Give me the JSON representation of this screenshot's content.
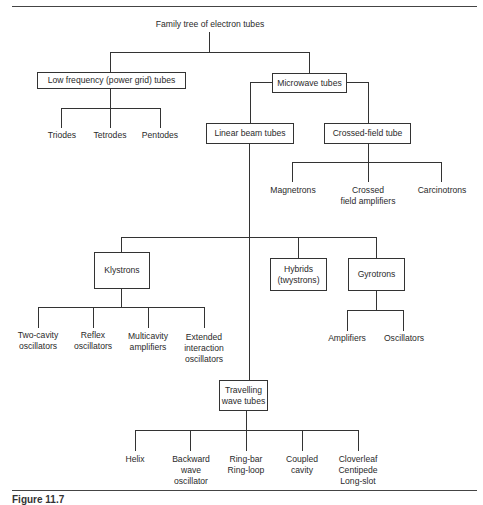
{
  "diagram": {
    "title": "Family tree of electron tubes",
    "caption": "Figure 11.7",
    "nodes": {
      "low_frequency": "Low frequency (power grid) tubes",
      "microwave": "Microwave tubes",
      "linear_beam": "Linear beam tubes",
      "crossed_field": "Crossed-field tube",
      "klystrons": "Klystrons",
      "hybrids": "Hybrids\n(twystrons)",
      "gyrotrons": "Gyrotrons",
      "twt": "Travelling\nwave tubes"
    },
    "low_frequency_children": [
      "Triodes",
      "Tetrodes",
      "Pentodes"
    ],
    "crossed_field_children": [
      "Magnetrons",
      "Crossed\nfield amplifiers",
      "Carcinotrons"
    ],
    "klystron_children": [
      "Two-cavity\noscillators",
      "Reflex\noscillators",
      "Multicavity\namplifiers",
      "Extended\ninteraction\noscillators"
    ],
    "gyrotron_children": [
      "Amplifiers",
      "Oscillators"
    ],
    "twt_children": [
      "Helix",
      "Backward\nwave\noscillator",
      "Ring-bar\nRing-loop",
      "Coupled\ncavity",
      "Cloverleaf\nCentipede\nLong-slot"
    ],
    "edges": [
      [
        "Family tree of electron tubes",
        "Low frequency (power grid) tubes"
      ],
      [
        "Family tree of electron tubes",
        "Microwave tubes"
      ],
      [
        "Low frequency (power grid) tubes",
        "Triodes"
      ],
      [
        "Low frequency (power grid) tubes",
        "Tetrodes"
      ],
      [
        "Low frequency (power grid) tubes",
        "Pentodes"
      ],
      [
        "Microwave tubes",
        "Linear beam tubes"
      ],
      [
        "Microwave tubes",
        "Crossed-field tube"
      ],
      [
        "Crossed-field tube",
        "Magnetrons"
      ],
      [
        "Crossed-field tube",
        "Crossed field amplifiers"
      ],
      [
        "Crossed-field tube",
        "Carcinotrons"
      ],
      [
        "Linear beam tubes",
        "Klystrons"
      ],
      [
        "Linear beam tubes",
        "Hybrids (twystrons)"
      ],
      [
        "Linear beam tubes",
        "Gyrotrons"
      ],
      [
        "Linear beam tubes",
        "Travelling wave tubes"
      ],
      [
        "Klystrons",
        "Two-cavity oscillators"
      ],
      [
        "Klystrons",
        "Reflex oscillators"
      ],
      [
        "Klystrons",
        "Multicavity amplifiers"
      ],
      [
        "Klystrons",
        "Extended interaction oscillators"
      ],
      [
        "Gyrotrons",
        "Amplifiers"
      ],
      [
        "Gyrotrons",
        "Oscillators"
      ],
      [
        "Travelling wave tubes",
        "Helix"
      ],
      [
        "Travelling wave tubes",
        "Backward wave oscillator"
      ],
      [
        "Travelling wave tubes",
        "Ring-bar Ring-loop"
      ],
      [
        "Travelling wave tubes",
        "Coupled cavity"
      ],
      [
        "Travelling wave tubes",
        "Cloverleaf Centipede Long-slot"
      ]
    ]
  }
}
